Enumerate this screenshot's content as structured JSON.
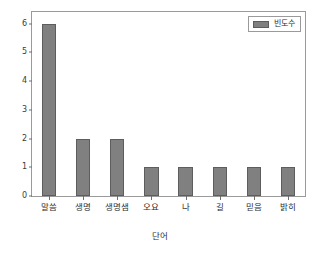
{
  "chart_data": {
    "type": "bar",
    "title": "",
    "subtitle": "",
    "categories": [
      "말씀",
      "생명",
      "생명샘",
      "오요",
      "나",
      "길",
      "믿음",
      "밝히"
    ],
    "values": [
      6,
      2,
      2,
      1,
      1,
      1,
      1,
      1
    ],
    "series": [
      {
        "name": "빈도수",
        "values": [
          6,
          2,
          2,
          1,
          1,
          1,
          1,
          1
        ]
      }
    ],
    "xlabel": "단어",
    "ylabel": "",
    "ylim": [
      0,
      6.4
    ],
    "yticks": [
      0,
      1,
      2,
      3,
      4,
      5,
      6
    ],
    "ytick_labels": [
      "0",
      "1",
      "2",
      "3",
      "4",
      "5",
      "6"
    ],
    "grid": false,
    "legend": {
      "position": "upper-right",
      "entries": [
        {
          "label": "빈도수",
          "color": "#808080"
        }
      ]
    },
    "bar_color": "#808080",
    "bar_edge_color": "#5d5d5d",
    "background_color": "#ffffff",
    "frame_color": "#9a9a9a"
  }
}
